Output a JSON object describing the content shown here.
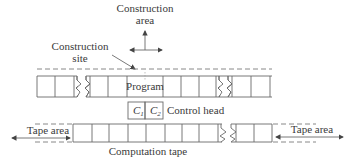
{
  "diagram": {
    "construction_area": {
      "line1": "Construction",
      "line2": "area"
    },
    "construction_site": {
      "line1": "Construction",
      "line2": "site"
    },
    "program_label": "Program",
    "control_head": {
      "c1": "C",
      "c1_sub": "1",
      "c2": "C",
      "c2_sub": "2",
      "label": "Control head"
    },
    "tape_area_left": "Tape area",
    "tape_area_right": "Tape area",
    "computation_tape": "Computation tape",
    "colors": {
      "line": "#6a6a6a",
      "text": "#3a3a3a",
      "background": "#ffffff"
    }
  }
}
